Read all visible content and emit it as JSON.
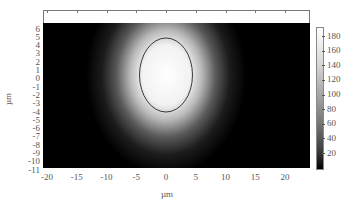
{
  "chart_data": {
    "type": "heatmap",
    "title": "",
    "xlabel": "µm",
    "ylabel": "µm",
    "xlim": [
      -21,
      24
    ],
    "ylim": [
      -11,
      7
    ],
    "x_ticks": [
      "-20",
      "-15",
      "-10",
      "-5",
      "0",
      "5",
      "10",
      "15",
      "20"
    ],
    "y_ticks": [
      "6",
      "5",
      "4",
      "3",
      "2",
      "1",
      "0",
      "-1",
      "-2",
      "-3",
      "-4",
      "-5",
      "-6",
      "-7",
      "-8",
      "-9",
      "-10",
      "-11"
    ],
    "colorbar": {
      "ticks": [
        "180",
        "160",
        "140",
        "120",
        "100",
        "80",
        "60",
        "40",
        "20"
      ],
      "range": [
        0,
        190
      ],
      "colormap": "gray"
    },
    "spot": {
      "center_x_um": 0,
      "center_y_um": 0.5,
      "peak_intensity": 190,
      "contour_ellipse": {
        "cx_um": 0,
        "cy_um": 0.5,
        "rx_um": 4.4,
        "ry_um": 4.5,
        "color": "#3a3a3a"
      }
    },
    "grid": false
  },
  "axes": {
    "xlabel": "µm",
    "ylabel": "µm"
  }
}
